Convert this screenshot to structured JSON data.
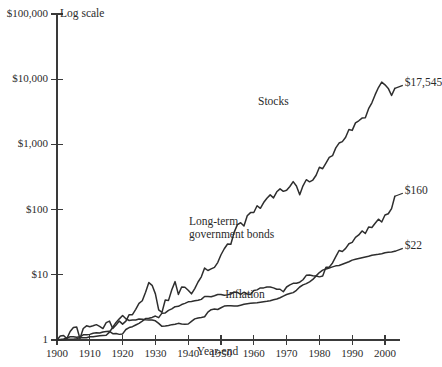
{
  "chart_data": {
    "type": "line",
    "title": "",
    "subtitle": "",
    "scale_note": "Log scale",
    "xlabel": "Year-end",
    "ylabel": "",
    "grid": false,
    "legend_position": "inline-annotations",
    "xlim": [
      1900,
      2003
    ],
    "ylim": [
      1,
      100000
    ],
    "yscale": "log",
    "ytick_labels": [
      "$100,000",
      "$10,000",
      "$1,000",
      "$100",
      "$10",
      "1"
    ],
    "ytick_values": [
      100000,
      10000,
      1000,
      100,
      10,
      1
    ],
    "xtick_labels": [
      "1900",
      "1910",
      "1920",
      "1930",
      "1940",
      "1950",
      "1960",
      "1970",
      "1980",
      "1990",
      "2000"
    ],
    "xtick_values": [
      1900,
      1910,
      1920,
      1930,
      1940,
      1950,
      1960,
      1970,
      1980,
      1990,
      2000
    ],
    "series": [
      {
        "name": "Stocks",
        "label": "Stocks",
        "end_label": "$17,545",
        "end_value": 17545,
        "x": [
          1900,
          1901,
          1902,
          1903,
          1904,
          1905,
          1906,
          1907,
          1908,
          1909,
          1910,
          1911,
          1912,
          1913,
          1914,
          1915,
          1916,
          1917,
          1918,
          1919,
          1920,
          1921,
          1922,
          1923,
          1924,
          1925,
          1926,
          1927,
          1928,
          1929,
          1930,
          1931,
          1932,
          1933,
          1934,
          1935,
          1936,
          1937,
          1938,
          1939,
          1940,
          1941,
          1942,
          1943,
          1944,
          1945,
          1946,
          1947,
          1948,
          1949,
          1950,
          1951,
          1952,
          1953,
          1954,
          1955,
          1956,
          1957,
          1958,
          1959,
          1960,
          1961,
          1962,
          1963,
          1964,
          1965,
          1966,
          1967,
          1968,
          1969,
          1970,
          1971,
          1972,
          1973,
          1974,
          1975,
          1976,
          1977,
          1978,
          1979,
          1980,
          1981,
          1982,
          1983,
          1984,
          1985,
          1986,
          1987,
          1988,
          1989,
          1990,
          1991,
          1992,
          1993,
          1994,
          1995,
          1996,
          1997,
          1998,
          1999,
          2000,
          2001,
          2002,
          2003
        ],
        "values": [
          1.0,
          1.15,
          1.17,
          1.05,
          1.35,
          1.55,
          1.58,
          1.05,
          1.5,
          1.65,
          1.6,
          1.65,
          1.72,
          1.62,
          1.5,
          1.85,
          1.95,
          1.5,
          1.7,
          1.95,
          1.75,
          1.95,
          2.45,
          2.45,
          2.95,
          3.65,
          4.0,
          5.4,
          7.6,
          6.9,
          5.1,
          2.9,
          2.65,
          4.1,
          4.05,
          5.9,
          7.85,
          5.0,
          6.5,
          6.45,
          5.8,
          5.1,
          6.15,
          7.75,
          9.3,
          12.7,
          11.65,
          12.3,
          13.0,
          15.4,
          20.3,
          25.1,
          29.7,
          29.4,
          44.8,
          58.9,
          62.8,
          56.0,
          80.3,
          89.9,
          90.3,
          114.6,
          104.6,
          128.4,
          149.7,
          168.3,
          151.3,
          187.5,
          208.0,
          190.4,
          197.9,
          226.3,
          269.1,
          229.6,
          168.8,
          231.7,
          287.1,
          266.5,
          284.0,
          336.4,
          445.7,
          423.7,
          514.8,
          630.9,
          670.8,
          883.6,
          1048.4,
          1103.2,
          1286.0,
          1693.1,
          1640.2,
          2139.7,
          2303.0,
          2534.7,
          2567.7,
          3532.7,
          4344.5,
          5792.8,
          7448.6,
          9015.6,
          8193.2,
          7222.9,
          5628.5,
          7244.3
        ],
        "label_x": 1968,
        "label_y_px": 103
      },
      {
        "name": "Long-term government bonds",
        "label": "Long-term\ngovernment bonds",
        "label_line1": "Long-term",
        "label_line2": "government bonds",
        "end_label": "$160",
        "end_value": 160,
        "x": [
          1900,
          1901,
          1902,
          1903,
          1904,
          1905,
          1906,
          1907,
          1908,
          1909,
          1910,
          1911,
          1912,
          1913,
          1914,
          1915,
          1916,
          1917,
          1918,
          1919,
          1920,
          1921,
          1922,
          1923,
          1924,
          1925,
          1926,
          1927,
          1928,
          1929,
          1930,
          1931,
          1932,
          1933,
          1934,
          1935,
          1936,
          1937,
          1938,
          1939,
          1940,
          1941,
          1942,
          1943,
          1944,
          1945,
          1946,
          1947,
          1948,
          1949,
          1950,
          1951,
          1952,
          1953,
          1954,
          1955,
          1956,
          1957,
          1958,
          1959,
          1960,
          1961,
          1962,
          1963,
          1964,
          1965,
          1966,
          1967,
          1968,
          1969,
          1970,
          1971,
          1972,
          1973,
          1974,
          1975,
          1976,
          1977,
          1978,
          1979,
          1980,
          1981,
          1982,
          1983,
          1984,
          1985,
          1986,
          1987,
          1988,
          1989,
          1990,
          1991,
          1992,
          1993,
          1994,
          1995,
          1996,
          1997,
          1998,
          1999,
          2000,
          2001,
          2002,
          2003
        ],
        "values": [
          1.0,
          1.02,
          1.04,
          1.07,
          1.12,
          1.12,
          1.1,
          1.12,
          1.2,
          1.2,
          1.22,
          1.27,
          1.29,
          1.28,
          1.33,
          1.35,
          1.36,
          1.25,
          1.26,
          1.22,
          1.24,
          1.45,
          1.55,
          1.6,
          1.7,
          1.8,
          1.95,
          2.13,
          2.15,
          2.22,
          2.33,
          2.2,
          2.58,
          2.6,
          2.85,
          3.0,
          3.25,
          3.28,
          3.5,
          3.65,
          3.85,
          3.9,
          3.99,
          4.07,
          4.2,
          4.65,
          4.65,
          4.6,
          4.78,
          5.0,
          5.0,
          4.85,
          4.92,
          5.06,
          5.45,
          5.36,
          5.0,
          5.4,
          5.08,
          5.0,
          5.75,
          5.87,
          6.3,
          6.3,
          6.5,
          6.5,
          6.3,
          6.0,
          6.0,
          5.5,
          6.5,
          7.0,
          7.4,
          7.4,
          7.7,
          8.4,
          9.8,
          9.9,
          9.7,
          9.6,
          9.3,
          9.6,
          13.1,
          13.1,
          15.2,
          19.0,
          23.6,
          22.8,
          25.4,
          29.9,
          31.4,
          37.5,
          40.8,
          47.1,
          43.0,
          53.9,
          53.1,
          61.9,
          71.3,
          64.6,
          82.5,
          86.3,
          103.6,
          160.0
        ],
        "label_x": 1957,
        "label_y_px": 223
      },
      {
        "name": "Inflation",
        "label": "Inflation",
        "end_label": "$22",
        "end_value": 22,
        "x": [
          1900,
          1901,
          1902,
          1903,
          1904,
          1905,
          1906,
          1907,
          1908,
          1909,
          1910,
          1911,
          1912,
          1913,
          1914,
          1915,
          1916,
          1917,
          1918,
          1919,
          1920,
          1921,
          1922,
          1923,
          1924,
          1925,
          1926,
          1927,
          1928,
          1929,
          1930,
          1931,
          1932,
          1933,
          1934,
          1935,
          1936,
          1937,
          1938,
          1939,
          1940,
          1941,
          1942,
          1943,
          1944,
          1945,
          1946,
          1947,
          1948,
          1949,
          1950,
          1951,
          1952,
          1953,
          1954,
          1955,
          1956,
          1957,
          1958,
          1959,
          1960,
          1961,
          1962,
          1963,
          1964,
          1965,
          1966,
          1967,
          1968,
          1969,
          1970,
          1971,
          1972,
          1973,
          1974,
          1975,
          1976,
          1977,
          1978,
          1979,
          1980,
          1981,
          1982,
          1983,
          1984,
          1985,
          1986,
          1987,
          1988,
          1989,
          1990,
          1991,
          1992,
          1993,
          1994,
          1995,
          1996,
          1997,
          1998,
          1999,
          2000,
          2001,
          2002,
          2003
        ],
        "values": [
          1.0,
          1.0,
          1.01,
          1.03,
          1.03,
          1.03,
          1.05,
          1.08,
          1.08,
          1.08,
          1.12,
          1.12,
          1.14,
          1.16,
          1.17,
          1.18,
          1.32,
          1.57,
          1.86,
          2.11,
          2.37,
          2.12,
          1.99,
          2.03,
          2.03,
          2.1,
          2.08,
          2.04,
          2.03,
          2.02,
          1.97,
          1.8,
          1.62,
          1.64,
          1.67,
          1.72,
          1.74,
          1.8,
          1.76,
          1.74,
          1.76,
          1.93,
          2.11,
          2.18,
          2.22,
          2.27,
          2.68,
          2.92,
          2.99,
          2.94,
          3.12,
          3.31,
          3.34,
          3.35,
          3.33,
          3.32,
          3.42,
          3.53,
          3.6,
          3.66,
          3.71,
          3.74,
          3.8,
          3.87,
          3.92,
          4.0,
          4.13,
          4.25,
          4.45,
          4.72,
          4.98,
          5.15,
          5.33,
          5.79,
          6.5,
          7.0,
          7.33,
          7.81,
          8.5,
          9.63,
          10.82,
          11.8,
          12.25,
          12.72,
          13.22,
          13.72,
          13.87,
          14.48,
          15.13,
          15.83,
          16.8,
          17.3,
          17.8,
          18.3,
          18.8,
          19.3,
          20.0,
          20.3,
          20.6,
          21.1,
          21.8,
          22.1,
          22.4,
          22.9
        ],
        "label_x": 1958,
        "label_y_px": 296
      }
    ]
  },
  "annotations": {
    "log_scale_note": "Log scale",
    "xaxis_title": "Year-end"
  }
}
